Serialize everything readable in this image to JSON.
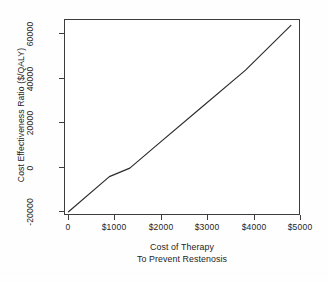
{
  "chart_data": {
    "type": "line",
    "title": "",
    "subtitle": "",
    "xlabel": "Cost of Therapy",
    "xlabel_line2": "To Prevent Restenosis",
    "ylabel": "Cost Effectiveness Ratio ($/QALY)",
    "xlim": [
      0,
      5200
    ],
    "ylim": [
      -22000,
      70000
    ],
    "grid": false,
    "legend": null,
    "x_ticks": [
      0,
      1000,
      2000,
      3000,
      4000,
      5000
    ],
    "x_ticklabels": [
      "0",
      "$1000",
      "$2000",
      "$3000",
      "$4000",
      "$5000"
    ],
    "y_ticks": [
      -20000,
      0,
      20000,
      40000,
      60000
    ],
    "y_ticklabels": [
      "-20000",
      "0",
      "20000",
      "40000",
      "60000"
    ],
    "series": [
      {
        "name": "Cost effectiveness ratio",
        "color": "#2b2b2b",
        "x": [
          100,
          1000,
          1450,
          2000,
          3000,
          4000,
          5000
        ],
        "values": [
          -20500,
          -4000,
          0,
          10000,
          28000,
          46000,
          67000
        ]
      }
    ],
    "annotations": []
  },
  "axis": {
    "y_title": "Cost Effectiveness Ratio ($/QALY)",
    "x_title_line1": "Cost of Therapy",
    "x_title_line2": "To Prevent Restenosis"
  },
  "colors": {
    "line": "#2b2b2b",
    "axis": "#3d3d3d",
    "background": "#ffffff",
    "text": "#242424"
  }
}
